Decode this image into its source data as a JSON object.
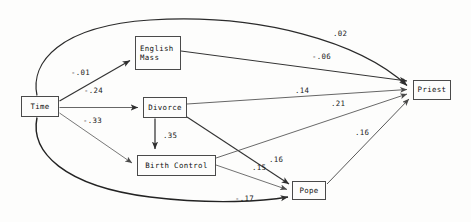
{
  "diagram": {
    "type": "path-diagram",
    "title": "",
    "nodes": [
      {
        "id": "time",
        "label": "Time",
        "x": 21,
        "y": 96,
        "w": 38,
        "h": 21
      },
      {
        "id": "english_mass",
        "label": "English\nMass",
        "x": 135,
        "y": 36,
        "w": 46,
        "h": 34
      },
      {
        "id": "divorce",
        "label": "Divorce",
        "x": 143,
        "y": 97,
        "w": 44,
        "h": 21
      },
      {
        "id": "birth_control",
        "label": "Birth Control",
        "x": 137,
        "y": 155,
        "w": 79,
        "h": 21
      },
      {
        "id": "pope",
        "label": "Pope",
        "x": 292,
        "y": 181,
        "w": 34,
        "h": 19
      },
      {
        "id": "priest",
        "label": "Priest",
        "x": 413,
        "y": 80,
        "w": 38,
        "h": 20
      }
    ],
    "edges": [
      {
        "id": "time-english_mass",
        "from": "time",
        "to": "english_mass",
        "coefficient": "-.01",
        "label_x": 71,
        "label_y": 69
      },
      {
        "id": "time-divorce",
        "from": "time",
        "to": "divorce",
        "coefficient": "-.24",
        "label_x": 84,
        "label_y": 87
      },
      {
        "id": "time-birth_control",
        "from": "time",
        "to": "birth_control",
        "coefficient": "-.33",
        "label_x": 83,
        "label_y": 117
      },
      {
        "id": "time-priest",
        "from": "time",
        "to": "priest",
        "coefficient": ".02",
        "label_x": 333,
        "label_y": 30
      },
      {
        "id": "time-pope",
        "from": "time",
        "to": "pope",
        "coefficient": "-.17",
        "label_x": 235,
        "label_y": 195
      },
      {
        "id": "english_mass-priest",
        "from": "english_mass",
        "to": "priest",
        "coefficient": "-.06",
        "label_x": 312,
        "label_y": 53
      },
      {
        "id": "divorce-priest",
        "from": "divorce",
        "to": "priest",
        "coefficient": ".14",
        "label_x": 295,
        "label_y": 87
      },
      {
        "id": "divorce-birth_control",
        "from": "divorce",
        "to": "birth_control",
        "coefficient": ".35",
        "label_x": 163,
        "label_y": 132
      },
      {
        "id": "divorce-pope",
        "from": "divorce",
        "to": "pope",
        "coefficient": ".16",
        "label_x": 269,
        "label_y": 156
      },
      {
        "id": "birth_control-priest",
        "from": "birth_control",
        "to": "priest",
        "coefficient": ".21",
        "label_x": 331,
        "label_y": 100
      },
      {
        "id": "birth_control-pope",
        "from": "birth_control",
        "to": "pope",
        "coefficient": ".15",
        "label_x": 252,
        "label_y": 164
      },
      {
        "id": "pope-priest",
        "from": "pope",
        "to": "priest",
        "coefficient": ".16",
        "label_x": 355,
        "label_y": 129
      }
    ],
    "colors": {
      "background": "#fdfdfc",
      "stroke": "#3c3c3c",
      "stroke_heavy": "#1c1c1c",
      "text": "#111111"
    }
  }
}
